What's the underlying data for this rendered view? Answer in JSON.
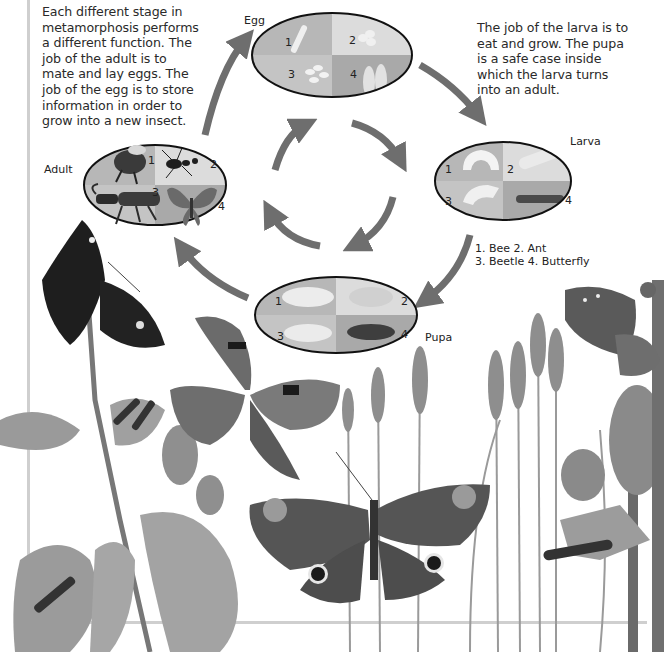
{
  "intro_text": {
    "left": [
      "Each different stage in",
      "metamorphosis performs",
      "a different function. The",
      "job of the adult is to",
      "mate and lay eggs. The",
      "job of the egg is to store",
      "information in order to",
      "grow into a new insect."
    ],
    "right": [
      "The job of the larva is to",
      "eat and grow. The pupa",
      "is a safe case inside",
      "which the larva turns",
      "into an adult."
    ]
  },
  "stages": {
    "egg": {
      "label": "Egg",
      "quadrants": [
        "1",
        "2",
        "3",
        "4"
      ]
    },
    "larva": {
      "label": "Larva",
      "quadrants": [
        "1",
        "2",
        "3",
        "4"
      ]
    },
    "pupa": {
      "label": "Pupa",
      "quadrants": [
        "1",
        "2",
        "3",
        "4"
      ]
    },
    "adult": {
      "label": "Adult",
      "quadrants": [
        "1",
        "2",
        "3",
        "4"
      ]
    }
  },
  "legend": {
    "line1": "1. Bee 2. Ant",
    "line2": "3. Beetle 4. Butterfly"
  },
  "colors": {
    "arrow": "#6e6e6e",
    "quad_dark": "#a9a9a9",
    "quad_mid": "#bdbdbd",
    "quad_light": "#dcdcdc",
    "frame": "#cfcfcf"
  }
}
